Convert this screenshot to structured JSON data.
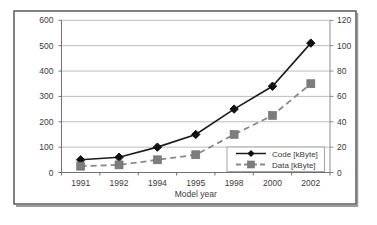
{
  "figure": {
    "background": "#ffffff",
    "frame_border_color": "#4d4d4d",
    "frame_shadow_color": "#9b9b9b"
  },
  "chart_data": {
    "type": "line",
    "title": "",
    "xlabel": "Model year",
    "ylabel_left": "",
    "ylabel_right": "",
    "categories": [
      "1991",
      "1992",
      "1994",
      "1995",
      "1998",
      "2000",
      "2002"
    ],
    "series": [
      {
        "name": "Code [kByte]",
        "axis": "left",
        "values": [
          50,
          60,
          100,
          150,
          250,
          340,
          510
        ],
        "color": "#1c1c1c",
        "line_style": "solid",
        "marker": "diamond",
        "marker_color": "#111111"
      },
      {
        "name": "Data [kByte]",
        "axis": "right",
        "values": [
          5,
          6,
          10,
          14,
          30,
          45,
          70
        ],
        "color": "#8a8a8a",
        "line_style": "dashed",
        "marker": "square",
        "marker_color": "#7d7d7d"
      }
    ],
    "axes": {
      "left": {
        "min": 0,
        "max": 600,
        "step": 100,
        "ticks": [
          "0",
          "100",
          "200",
          "300",
          "400",
          "500",
          "600"
        ]
      },
      "right": {
        "min": 0,
        "max": 120,
        "step": 20,
        "ticks": [
          "0",
          "20",
          "40",
          "60",
          "80",
          "100",
          "120"
        ]
      }
    },
    "grid": true,
    "legend_position": "inside-bottom-right",
    "colors": {
      "gridline": "#bdbdbd",
      "axis_line": "#707070",
      "right_axis_line": "#8d8d8d",
      "tick_text": "#3a3a3a",
      "legend_border": "#9a9a9a",
      "legend_background": "#ffffff"
    }
  }
}
